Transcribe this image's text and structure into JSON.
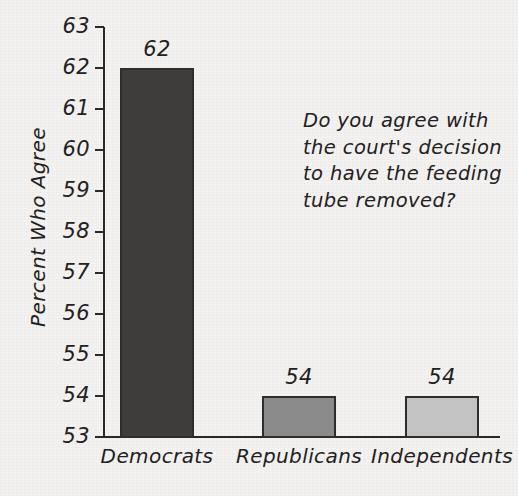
{
  "chart_data": {
    "type": "bar",
    "title": "",
    "xlabel": "",
    "ylabel": "Percent Who Agree",
    "categories": [
      "Democrats",
      "Republicans",
      "Independents"
    ],
    "values": [
      62,
      54,
      54
    ],
    "value_labels": [
      "62",
      "54",
      "54"
    ],
    "bar_colors": [
      "#3f3d3b",
      "#8b8b8b",
      "#c3c3c3"
    ],
    "bar_edge_color": "#2f2d2b",
    "ylim": [
      53,
      63
    ],
    "y_ticks": [
      63,
      62,
      61,
      60,
      59,
      58,
      57,
      56,
      55,
      54,
      53
    ],
    "y_tick_labels": [
      "63",
      "62",
      "61",
      "60",
      "59",
      "58",
      "57",
      "56",
      "55",
      "54",
      "53"
    ],
    "grid": false,
    "legend": "none",
    "annotation": "Do you agree with the court's decision to have the feeding tube removed?",
    "annotation_lines": [
      "Do you agree with",
      "the court's decision",
      "to have the feeding",
      "tube removed?"
    ],
    "background_color": "#f3f2f0",
    "axis_color": "#2b2927",
    "text_color": "#23201e"
  }
}
